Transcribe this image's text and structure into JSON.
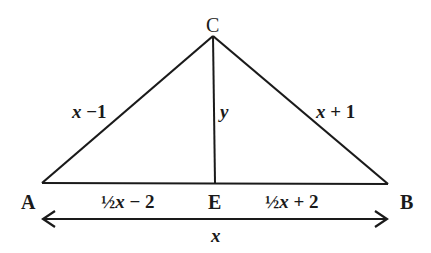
{
  "diagram": {
    "type": "triangle-with-altitude",
    "points": {
      "A": {
        "label": "A",
        "x": 42,
        "y": 183
      },
      "B": {
        "label": "B",
        "x": 388,
        "y": 184
      },
      "C": {
        "label": "C",
        "x": 213,
        "y": 36
      },
      "E": {
        "label": "E",
        "x": 215,
        "y": 183
      }
    },
    "segments": {
      "AC": {
        "label": "x −1"
      },
      "BC": {
        "label": "x + 1"
      },
      "CE": {
        "label": "y"
      },
      "AE": {
        "label": "½x − 2"
      },
      "EB": {
        "label": "½x + 2"
      },
      "AB": {
        "label": "x"
      }
    },
    "colors": {
      "line": "#1a1a1a",
      "background": "#ffffff"
    }
  }
}
